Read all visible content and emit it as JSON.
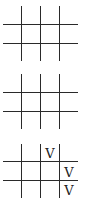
{
  "diagram": {
    "type": "tic-tac-toe-grid-sequence",
    "line_color": "#2a2a2a",
    "grids": [
      {
        "id": "grid-1",
        "top": 6,
        "cells": [
          [
            "",
            "",
            ""
          ],
          [
            "",
            "",
            ""
          ],
          [
            "",
            "",
            ""
          ]
        ]
      },
      {
        "id": "grid-2",
        "top": 74,
        "cells": [
          [
            "",
            "",
            ""
          ],
          [
            "",
            "",
            ""
          ],
          [
            "",
            "",
            ""
          ]
        ]
      },
      {
        "id": "grid-3",
        "top": 144,
        "cells": [
          [
            "",
            "V",
            ""
          ],
          [
            "",
            "",
            "V"
          ],
          [
            "",
            "",
            "V"
          ]
        ]
      }
    ]
  }
}
